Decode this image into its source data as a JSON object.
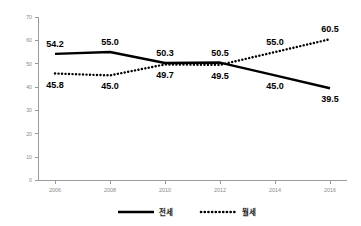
{
  "chart_data": {
    "type": "line",
    "title": "",
    "subtitle": "",
    "xlabel": "",
    "ylabel": "",
    "categories": [
      "2006",
      "2008",
      "2010",
      "2012",
      "2014",
      "2016"
    ],
    "x": [
      2006,
      2008,
      2010,
      2012,
      2014,
      2016
    ],
    "ylim": [
      0,
      70
    ],
    "yticks": [
      0,
      10,
      20,
      30,
      40,
      50,
      60,
      70
    ],
    "ytick_labels": [
      "0",
      "10",
      "20",
      "30",
      "40",
      "50",
      "60",
      "70"
    ],
    "xtick_labels": [
      "2006",
      "2008",
      "2010",
      "2012",
      "2014",
      "2016"
    ],
    "grid": false,
    "legend_position": "bottom",
    "series": [
      {
        "name": "전세",
        "style": "solid",
        "color": "#000000",
        "values": [
          54.2,
          55.0,
          50.3,
          50.5,
          45.0,
          39.5
        ],
        "labels": [
          "54.2",
          "55.0",
          "50.3",
          "50.5",
          "45.0",
          "39.5"
        ],
        "label_positions": [
          "above",
          "above",
          "above",
          "above",
          "below",
          "below"
        ]
      },
      {
        "name": "월세",
        "style": "dotted",
        "color": "#000000",
        "values": [
          45.8,
          45.0,
          49.7,
          49.5,
          55.0,
          60.5
        ],
        "labels": [
          "45.8",
          "45.0",
          "49.7",
          "49.5",
          "55.0",
          "60.5"
        ],
        "label_positions": [
          "below",
          "below",
          "below",
          "below",
          "above",
          "above"
        ]
      }
    ],
    "legend": [
      {
        "label": "전세",
        "style": "solid"
      },
      {
        "label": "월세",
        "style": "dotted"
      }
    ]
  }
}
